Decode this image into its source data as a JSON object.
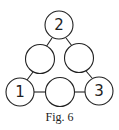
{
  "figure": {
    "caption": "Fig. 6",
    "nodes": [
      {
        "id": "top",
        "label": "2"
      },
      {
        "id": "mid-left",
        "label": ""
      },
      {
        "id": "mid-right",
        "label": ""
      },
      {
        "id": "bottom-left",
        "label": "1"
      },
      {
        "id": "bottom-middle",
        "label": ""
      },
      {
        "id": "bottom-right",
        "label": "3"
      }
    ]
  }
}
